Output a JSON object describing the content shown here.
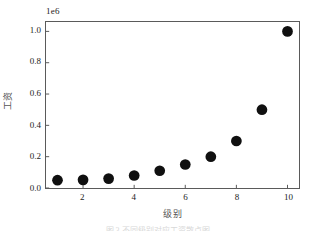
{
  "chart_data": {
    "type": "scatter",
    "title": "",
    "xlabel": "级别",
    "ylabel": "工资",
    "offset_label": "1e6",
    "x": [
      1,
      2,
      3,
      4,
      5,
      6,
      7,
      8,
      9,
      10
    ],
    "values": [
      50000,
      52000,
      60000,
      80000,
      110000,
      150000,
      200000,
      300000,
      500000,
      1000000
    ],
    "series": [
      {
        "name": "工资",
        "values": [
          50000,
          52000,
          60000,
          80000,
          110000,
          150000,
          200000,
          300000,
          500000,
          1000000
        ]
      }
    ],
    "xlim": [
      0.55,
      10.45
    ],
    "ylim": [
      0,
      1060000
    ],
    "y_scale_divisor": 1000000,
    "xticks": [
      2,
      4,
      6,
      8,
      10
    ],
    "xticklabels": [
      "2",
      "4",
      "6",
      "8",
      "10"
    ],
    "yticks": [
      0,
      200000,
      400000,
      600000,
      800000,
      1000000
    ],
    "yticklabels": [
      "0.0",
      "0.2",
      "0.4",
      "0.6",
      "0.8",
      "1.0"
    ],
    "grid": false,
    "legend": null,
    "marker": "circle",
    "marker_color": "#101010",
    "marker_size": 5.4,
    "frame_color": "#5a5a5a",
    "background_color": "#ffffff",
    "tick_label_color": "#1c1c1c",
    "axis_label_color": "#555555"
  },
  "caption": {
    "sliver_text": "图 3  不同级别对应工资散点图"
  }
}
